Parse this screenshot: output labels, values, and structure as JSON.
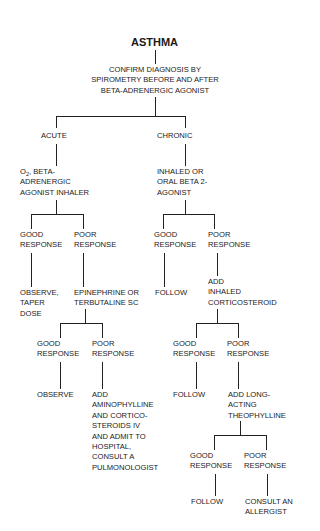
{
  "title": "ASTHMA",
  "root": {
    "text": "CONFIRM DIAGNOSIS BY\nSPIROMETRY BEFORE AND AFTER\nBETA-ADRENERGIC AGONIST"
  },
  "acute": {
    "label": "ACUTE",
    "treatment_prefix": "O",
    "treatment_sub": "2",
    "treatment_rest": ", BETA-\nADRENERGIC\nAGONIST INHALER",
    "good": {
      "label": "GOOD\nRESPONSE",
      "action": "OBSERVE,\nTAPER\nDOSE"
    },
    "poor": {
      "label": "POOR\nRESPONSE",
      "action": "EPINEPHRINE OR\nTERBUTALINE SC",
      "good": {
        "label": "GOOD\nRESPONSE",
        "action": "OBSERVE"
      },
      "poor": {
        "label": "POOR\nRESPONSE",
        "action": "ADD\nAMINOPHYLLINE\nAND CORTICO-\nSTEROIDS IV\nAND ADMIT TO\nHOSPITAL,\nCONSULT A\nPULMONOLOGIST"
      }
    }
  },
  "chronic": {
    "label": "CHRONIC",
    "treatment": "INHALED OR\nORAL BETA 2-\nAGONIST",
    "good": {
      "label": "GOOD\nRESPONSE",
      "action": "FOLLOW"
    },
    "poor": {
      "label": "POOR\nRESPONSE",
      "action": "ADD\nINHALED\nCORTICOSTEROID",
      "good": {
        "label": "GOOD\nRESPONSE",
        "action": "FOLLOW"
      },
      "poor": {
        "label": "POOR\nRESPONSE",
        "action": "ADD LONG-\nACTING\nTHEOPHYLLINE",
        "good": {
          "label": "GOOD\nRESPONSE",
          "action": "FOLLOW"
        },
        "poor": {
          "label": "POOR\nRESPONSE",
          "action": "CONSULT AN\nALLERGIST"
        }
      }
    }
  }
}
